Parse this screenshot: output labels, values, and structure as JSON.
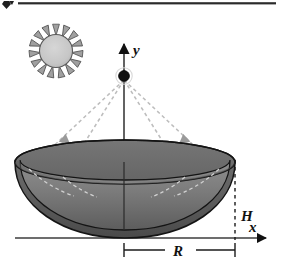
{
  "figure": {
    "caption_rule": {
      "present": true,
      "marker": "diamond-bullet"
    },
    "axes": {
      "x_label": "x",
      "y_label": "y",
      "x_axis": {
        "x1": 15,
        "y1": 238,
        "x2": 268,
        "y2": 238,
        "arrow": "right"
      },
      "y_axis": {
        "x1": 124,
        "y1": 238,
        "x2": 124,
        "y2": 40,
        "arrow": "up"
      }
    },
    "dimensions": [
      {
        "name": "H",
        "label": "H",
        "type": "vertical-dashed",
        "x": 235,
        "y_top": 162,
        "y_bottom": 238,
        "label_x": 244,
        "label_y": 218
      },
      {
        "name": "R",
        "label": "R",
        "type": "horizontal-dimension",
        "y": 250,
        "x_left": 124,
        "x_right": 235,
        "label_x": 180,
        "label_y": 256
      }
    ],
    "focus_point": {
      "name": "point-source",
      "cx": 124,
      "cy": 76,
      "r": 5.2,
      "color": "#111111"
    },
    "sun": {
      "cx": 56,
      "cy": 51,
      "disc_radius": 17,
      "ray_count": 15,
      "ray_inner": 16,
      "ray_outer": 27,
      "disc_color": "#c9c9c9",
      "ray_color": "#9a9a9a",
      "outline_color": "#4a4a4a"
    },
    "dish": {
      "name": "paraboloid-reflector",
      "rim_left_x": 15,
      "rim_right_x": 235,
      "rim_center_x": 125,
      "rim_center_y": 162,
      "rim_ry": 22,
      "bottom_y": 237,
      "interior_color_top": "#8d8d8d",
      "interior_color_bottom": "#5e5e5e",
      "exterior_color_top": "#6f6f6f",
      "exterior_color_bottom": "#4b4b4b",
      "outline_color": "#1a1a1a"
    },
    "rays": {
      "count": 4,
      "style": "dashed",
      "color": "#b5b5b5",
      "arrow_color": "#8f8f8f",
      "segments": [
        {
          "name": "ray-outer-left",
          "x1": 124,
          "y1": 78,
          "x2": 30,
          "y2": 168,
          "arrow_t": 0.56
        },
        {
          "name": "ray-inner-left",
          "x1": 124,
          "y1": 78,
          "x2": 62,
          "y2": 176,
          "arrow_t": 0.6
        },
        {
          "name": "ray-inner-right",
          "x1": 124,
          "y1": 78,
          "x2": 186,
          "y2": 176,
          "arrow_t": 0.6
        },
        {
          "name": "ray-outer-right",
          "x1": 124,
          "y1": 78,
          "x2": 219,
          "y2": 168,
          "arrow_t": 0.56
        }
      ]
    },
    "hidden_edges": {
      "name": "back-rim-dashed-arcs",
      "color": "#cfcfcf",
      "style": "dashed"
    },
    "colors": {
      "background": "#ffffff",
      "ink": "#111111",
      "rule": "#2b2b2b"
    }
  }
}
